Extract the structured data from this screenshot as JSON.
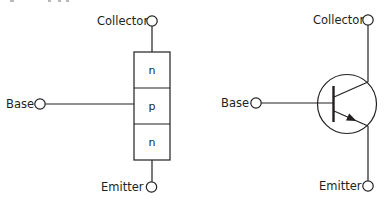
{
  "diagram": {
    "type": "transistor-comparison",
    "colors": {
      "stroke": "#231f20",
      "background": "#ffffff"
    },
    "left": {
      "title": "npn layered structure",
      "layers": [
        "n",
        "p",
        "n"
      ],
      "terminals": {
        "collector": "Collector",
        "base": "Base",
        "emitter": "Emitter"
      }
    },
    "right": {
      "title": "npn transistor symbol",
      "terminals": {
        "collector": "Collector",
        "base": "Base",
        "emitter": "Emitter"
      }
    }
  }
}
